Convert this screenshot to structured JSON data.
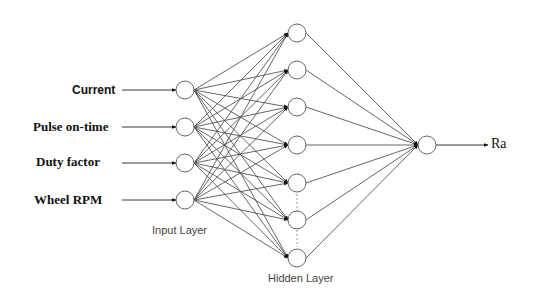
{
  "diagram": {
    "type": "feed-forward neural network",
    "inputs": [
      {
        "label": "Current",
        "style": "sans"
      },
      {
        "label": "Pulse on-time",
        "style": "serif"
      },
      {
        "label": "Duty factor",
        "style": "serif"
      },
      {
        "label": "Wheel RPM",
        "style": "serif"
      }
    ],
    "input_layer_label": "Input Layer",
    "hidden_layer_label": "Hidden Layer",
    "hidden_node_count": 7,
    "hidden_ellipsis_between": [
      5,
      6
    ],
    "output": {
      "label": "Ra"
    },
    "colors": {
      "line": "#555555",
      "node_stroke": "#666666",
      "arrow": "#111111",
      "text": "#111111"
    }
  }
}
